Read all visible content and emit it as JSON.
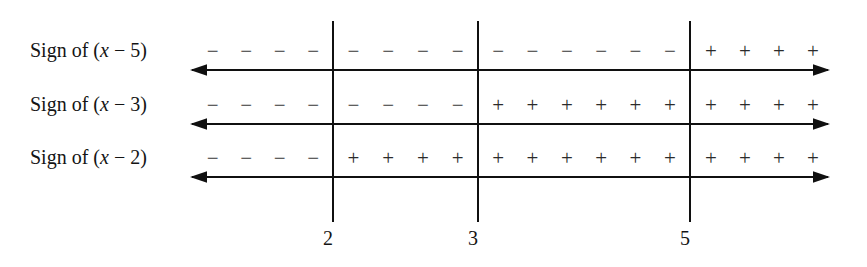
{
  "figure": {
    "background_color": "#ffffff",
    "line_color": "#101010",
    "symbol_color": "#2b2b2b"
  },
  "axis": {
    "left_arrow": "leftwards-arrow",
    "right_arrow": "rightwards-arrow",
    "left_x": 190,
    "right_x": 830
  },
  "dividers": [
    {
      "value": "2",
      "x": 332
    },
    {
      "value": "3",
      "x": 477
    },
    {
      "value": "5",
      "x": 689
    }
  ],
  "rows": [
    {
      "id": "row-x-minus-5",
      "label_prefix": "Sign of (",
      "label_var": "x",
      "label_op": " − ",
      "label_const": "5",
      "label_suffix": ")",
      "label_text": "Sign of (x − 5)",
      "expression": "x - 5",
      "y_label": 40,
      "y_signs": 40,
      "y_axis": 63,
      "regions": [
        {
          "interval": "(-∞, 2)",
          "sign": "−",
          "count": 4
        },
        {
          "interval": "(2, 3)",
          "sign": "−",
          "count": 4
        },
        {
          "interval": "(3, 5)",
          "sign": "−",
          "count": 6
        },
        {
          "interval": "(5, ∞)",
          "sign": "+",
          "count": 4
        }
      ]
    },
    {
      "id": "row-x-minus-3",
      "label_prefix": "Sign of (",
      "label_var": "x",
      "label_op": " − ",
      "label_const": "3",
      "label_suffix": ")",
      "label_text": "Sign of (x − 3)",
      "expression": "x - 3",
      "y_label": 94,
      "y_signs": 94,
      "y_axis": 117,
      "regions": [
        {
          "interval": "(-∞, 2)",
          "sign": "−",
          "count": 4
        },
        {
          "interval": "(2, 3)",
          "sign": "−",
          "count": 4
        },
        {
          "interval": "(3, 5)",
          "sign": "+",
          "count": 6
        },
        {
          "interval": "(5, ∞)",
          "sign": "+",
          "count": 4
        }
      ]
    },
    {
      "id": "row-x-minus-2",
      "label_prefix": "Sign of (",
      "label_var": "x",
      "label_op": " − ",
      "label_const": "2",
      "label_suffix": ")",
      "label_text": "Sign of (x − 2)",
      "expression": "x - 2",
      "y_label": 147,
      "y_signs": 147,
      "y_axis": 170,
      "regions": [
        {
          "interval": "(-∞, 2)",
          "sign": "−",
          "count": 4
        },
        {
          "interval": "(2, 3)",
          "sign": "+",
          "count": 4
        },
        {
          "interval": "(3, 5)",
          "sign": "+",
          "count": 6
        },
        {
          "interval": "(5, ∞)",
          "sign": "+",
          "count": 4
        }
      ]
    }
  ],
  "region_bounds": [
    {
      "name": "left-of-2",
      "start": 196,
      "end": 330
    },
    {
      "name": "between-2-and-3",
      "start": 336,
      "end": 475
    },
    {
      "name": "between-3-and-5",
      "start": 481,
      "end": 687
    },
    {
      "name": "right-of-5",
      "start": 694,
      "end": 830
    }
  ]
}
